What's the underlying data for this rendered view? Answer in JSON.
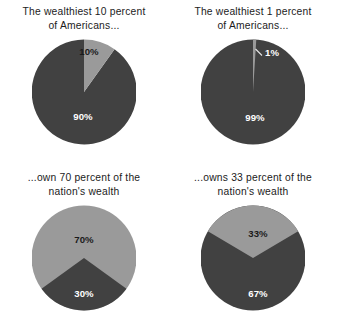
{
  "figure": {
    "background_color": "#ffffff",
    "dark_color": "#414141",
    "light_color": "#9a9a9a",
    "label_on_dark_color": "#ffffff",
    "label_on_light_color": "#1a1a1a",
    "caption_color": "#1c1c1c"
  },
  "chart_data": [
    {
      "type": "pie",
      "id": "wealthiest-10-percent",
      "title": "The wealthiest 10 percent\nof Americans...",
      "labels": [
        "10%",
        "90%"
      ],
      "values": [
        10,
        90
      ],
      "colors": [
        "#9a9a9a",
        "#414141"
      ],
      "label_texts": [
        "10%",
        "90%"
      ],
      "start_angle_deg": -18,
      "legend": "none",
      "grid": false
    },
    {
      "type": "pie",
      "id": "wealthiest-1-percent",
      "title": "The wealthiest 1 percent\nof Americans...",
      "labels": [
        "1%",
        "99%"
      ],
      "values": [
        1,
        99
      ],
      "colors": [
        "#9a9a9a",
        "#414141"
      ],
      "label_texts": [
        "1%",
        "99%"
      ],
      "start_angle_deg": -1.8,
      "legend": "none",
      "grid": false,
      "annotation": "1% slice drawn as thin sliver with leader line"
    },
    {
      "type": "pie",
      "id": "own-70-percent",
      "title": "...own 70 percent of the\nnation's wealth",
      "labels": [
        "70%",
        "30%"
      ],
      "values": [
        70,
        30
      ],
      "colors": [
        "#9a9a9a",
        "#414141"
      ],
      "label_texts": [
        "70%",
        "30%"
      ],
      "start_angle_deg": 126,
      "legend": "none",
      "grid": false
    },
    {
      "type": "pie",
      "id": "owns-33-percent",
      "title": "...owns 33 percent of the\nnation's wealth",
      "labels": [
        "33%",
        "67%"
      ],
      "values": [
        33,
        67
      ],
      "colors": [
        "#9a9a9a",
        "#414141"
      ],
      "label_texts": [
        "33%",
        "67%"
      ],
      "start_angle_deg": -59.4,
      "legend": "none",
      "grid": false
    }
  ],
  "panels": {
    "top_left": {
      "caption": "The wealthiest 10 percent\nof Americans...",
      "light_label": "10%",
      "dark_label": "90%"
    },
    "top_right": {
      "caption": "The wealthiest 1 percent\nof Americans...",
      "light_label": "1%",
      "dark_label": "99%"
    },
    "bottom_left": {
      "caption": "...own 70 percent of the\nnation's wealth",
      "light_label": "70%",
      "dark_label": "30%"
    },
    "bottom_right": {
      "caption": "...owns 33 percent of the\nnation's wealth",
      "light_label": "33%",
      "dark_label": "67%"
    }
  }
}
